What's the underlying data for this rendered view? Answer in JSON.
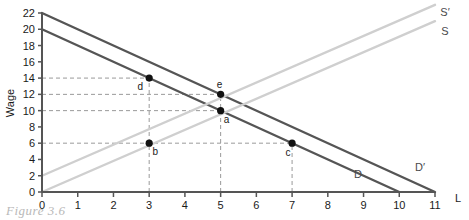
{
  "figure": {
    "caption": "Figure 3.6"
  },
  "chart_data": {
    "type": "line",
    "title": "",
    "xlabel": "L",
    "ylabel": "Wage",
    "xlim": [
      0,
      11
    ],
    "ylim": [
      0,
      22
    ],
    "xticks": [
      0,
      1,
      2,
      3,
      4,
      5,
      6,
      7,
      8,
      9,
      10,
      11
    ],
    "yticks": [
      0,
      2,
      4,
      6,
      8,
      10,
      12,
      14,
      16,
      18,
      20,
      22
    ],
    "grid": false,
    "legend": "inline-curve-labels",
    "series": [
      {
        "name": "D",
        "label": "D",
        "color": "#555555",
        "x": [
          0,
          10
        ],
        "y": [
          20,
          0
        ]
      },
      {
        "name": "D'",
        "label": "D′",
        "color": "#555555",
        "x": [
          0,
          11
        ],
        "y": [
          22,
          0
        ]
      },
      {
        "name": "S",
        "label": "S",
        "color": "#cfcfcf",
        "x": [
          0,
          11
        ],
        "y": [
          0,
          21
        ]
      },
      {
        "name": "S'",
        "label": "S′",
        "color": "#cfcfcf",
        "x": [
          0,
          11
        ],
        "y": [
          2,
          23
        ]
      }
    ],
    "points": [
      {
        "label": "a",
        "x": 5,
        "y": 10
      },
      {
        "label": "b",
        "x": 3,
        "y": 6
      },
      {
        "label": "c",
        "x": 7,
        "y": 6
      },
      {
        "label": "d",
        "x": 3,
        "y": 14
      },
      {
        "label": "e",
        "x": 5,
        "y": 12
      }
    ],
    "guides": {
      "horizontal": [
        14,
        12,
        10,
        6
      ],
      "vertical": [
        3,
        5,
        7
      ]
    },
    "axis_color": "#555555",
    "guide_color": "#9a9a9a"
  },
  "tick_text": {
    "x": [
      "0",
      "1",
      "2",
      "3",
      "4",
      "5",
      "6",
      "7",
      "8",
      "9",
      "10",
      "11"
    ],
    "y": [
      "0",
      "2",
      "4",
      "6",
      "8",
      "10",
      "12",
      "14",
      "16",
      "18",
      "20",
      "22"
    ]
  },
  "labels": {
    "x_axis": "L",
    "y_axis": "Wage",
    "curves": {
      "d": "D",
      "d_prime": "D′",
      "s": "S",
      "s_prime": "S′"
    },
    "points": {
      "a": "a",
      "b": "b",
      "c": "c",
      "d": "d",
      "e": "e"
    }
  }
}
